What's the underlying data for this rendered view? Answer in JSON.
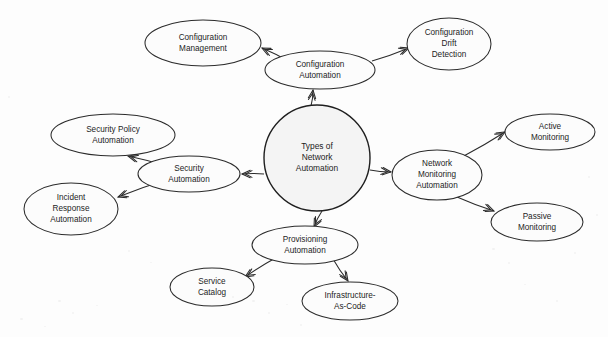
{
  "diagram": {
    "type": "node-link-mind-map",
    "background_color": "#fdfdfd",
    "stroke_color": "#2b2b2b",
    "text_color": "#1c1c1c",
    "hub_fill": "#f4f4f4",
    "node_fill": "#fcfcfc",
    "width": 608,
    "height": 337,
    "hub": {
      "id": "hub",
      "label": "Types of Network Automation",
      "lines": [
        "Types of",
        "Network",
        "Automation"
      ],
      "shape": "circle",
      "cx": 317,
      "cy": 158,
      "r": 53
    },
    "nodes": [
      {
        "id": "configuration-management",
        "label": "Configuration Management",
        "lines": [
          "Configuration",
          "Management"
        ],
        "shape": "ellipse",
        "cx": 203,
        "cy": 43,
        "rx": 58,
        "ry": 23
      },
      {
        "id": "configuration-automation",
        "label": "Configuration Automation",
        "lines": [
          "Configuration",
          "Automation"
        ],
        "shape": "ellipse",
        "cx": 320,
        "cy": 70,
        "rx": 55,
        "ry": 19
      },
      {
        "id": "configuration-drift-detection",
        "label": "Configuration Drift Detection",
        "lines": [
          "Configuration",
          "Drift",
          "Detection"
        ],
        "shape": "ellipse",
        "cx": 449,
        "cy": 44,
        "rx": 42,
        "ry": 26
      },
      {
        "id": "security-policy-automation",
        "label": "Security Policy Automation",
        "lines": [
          "Security Policy",
          "Automation"
        ],
        "shape": "ellipse",
        "cx": 113,
        "cy": 135,
        "rx": 62,
        "ry": 21
      },
      {
        "id": "security-automation",
        "label": "Security Automation",
        "lines": [
          "Security",
          "Automation"
        ],
        "shape": "ellipse",
        "cx": 189,
        "cy": 174,
        "rx": 51,
        "ry": 18
      },
      {
        "id": "incident-response-automation",
        "label": "Incident Response Automation",
        "lines": [
          "Incident",
          "Response",
          "Automation"
        ],
        "shape": "ellipse",
        "cx": 71,
        "cy": 209,
        "rx": 47,
        "ry": 26
      },
      {
        "id": "network-monitoring-automation",
        "label": "Network Monitoring Automation",
        "lines": [
          "Network",
          "Monitoring",
          "Automation"
        ],
        "shape": "ellipse",
        "cx": 437,
        "cy": 175,
        "rx": 45,
        "ry": 25
      },
      {
        "id": "active-monitoring",
        "label": "Active Monitoring",
        "lines": [
          "Active",
          "Monitoring"
        ],
        "shape": "ellipse",
        "cx": 550,
        "cy": 132,
        "rx": 45,
        "ry": 18
      },
      {
        "id": "passive-monitoring",
        "label": "Passive Monitoring",
        "lines": [
          "Passive",
          "Monitoring"
        ],
        "shape": "ellipse",
        "cx": 537,
        "cy": 222,
        "rx": 46,
        "ry": 19
      },
      {
        "id": "provisioning-automation",
        "label": "Provisioning Automation",
        "lines": [
          "Provisioning",
          "Automation"
        ],
        "shape": "ellipse",
        "cx": 305,
        "cy": 245,
        "rx": 53,
        "ry": 19
      },
      {
        "id": "service-catalog",
        "label": "Service Catalog",
        "lines": [
          "Service",
          "Catalog"
        ],
        "shape": "ellipse",
        "cx": 212,
        "cy": 287,
        "rx": 42,
        "ry": 19
      },
      {
        "id": "infrastructure-as-code",
        "label": "Infrastructure-As-Code",
        "lines": [
          "Infrastructure-",
          "As-Code"
        ],
        "shape": "ellipse",
        "cx": 350,
        "cy": 301,
        "rx": 48,
        "ry": 19
      }
    ],
    "edges": [
      {
        "id": "edge-hub-configuration-automation",
        "from": "hub",
        "to": "configuration-automation",
        "x1": 311,
        "y1": 106,
        "x2": 313,
        "y2": 90
      },
      {
        "id": "edge-configuration-automation-configuration-management",
        "from": "configuration-automation",
        "to": "configuration-management",
        "x1": 290,
        "y1": 62,
        "x2": 262,
        "y2": 48
      },
      {
        "id": "edge-configuration-automation-configuration-drift-detection",
        "from": "configuration-automation",
        "to": "configuration-drift-detection",
        "x1": 372,
        "y1": 61,
        "x2": 409,
        "y2": 48
      },
      {
        "id": "edge-hub-security-automation",
        "from": "hub",
        "to": "security-automation",
        "x1": 264,
        "y1": 174,
        "x2": 242,
        "y2": 174
      },
      {
        "id": "edge-security-automation-security-policy-automation",
        "from": "security-automation",
        "to": "security-policy-automation",
        "x1": 166,
        "y1": 166,
        "x2": 128,
        "y2": 156
      },
      {
        "id": "edge-security-automation-incident-response-automation",
        "from": "security-automation",
        "to": "incident-response-automation",
        "x1": 166,
        "y1": 180,
        "x2": 118,
        "y2": 197
      },
      {
        "id": "edge-hub-network-monitoring-automation",
        "from": "hub",
        "to": "network-monitoring-automation",
        "x1": 370,
        "y1": 170,
        "x2": 391,
        "y2": 172
      },
      {
        "id": "edge-network-monitoring-automation-active-monitoring",
        "from": "network-monitoring-automation",
        "to": "active-monitoring",
        "x1": 462,
        "y1": 157,
        "x2": 505,
        "y2": 132
      },
      {
        "id": "edge-network-monitoring-automation-passive-monitoring",
        "from": "network-monitoring-automation",
        "to": "passive-monitoring",
        "x1": 457,
        "y1": 197,
        "x2": 494,
        "y2": 211
      },
      {
        "id": "edge-hub-provisioning-automation",
        "from": "hub",
        "to": "provisioning-automation",
        "x1": 322,
        "y1": 211,
        "x2": 314,
        "y2": 227
      },
      {
        "id": "edge-provisioning-automation-service-catalog",
        "from": "provisioning-automation",
        "to": "service-catalog",
        "x1": 279,
        "y1": 256,
        "x2": 245,
        "y2": 277
      },
      {
        "id": "edge-provisioning-automation-infrastructure-as-code",
        "from": "provisioning-automation",
        "to": "infrastructure-as-code",
        "x1": 333,
        "y1": 259,
        "x2": 348,
        "y2": 281
      }
    ]
  }
}
